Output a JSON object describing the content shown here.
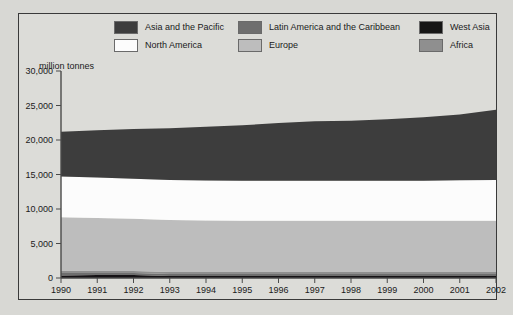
{
  "axis_title": "million tonnes",
  "legend": {
    "items": [
      {
        "label": "Asia and the Pacific",
        "color": "#3d3d3d",
        "col": 0,
        "row": 0
      },
      {
        "label": "North America",
        "color": "#fcfcfc",
        "col": 0,
        "row": 1
      },
      {
        "label": "Latin America and the Caribbean",
        "color": "#6e6e6e",
        "col": 1,
        "row": 0
      },
      {
        "label": "Europe",
        "color": "#bdbdbd",
        "col": 1,
        "row": 1
      },
      {
        "label": "West Asia",
        "color": "#151515",
        "col": 2,
        "row": 0
      },
      {
        "label": "Africa",
        "color": "#8f8f8f",
        "col": 2,
        "row": 1
      }
    ]
  },
  "chart_data": {
    "type": "area",
    "title": "",
    "subtitle": "",
    "xlabel": "",
    "ylabel": "million tonnes",
    "stacked": true,
    "grid": false,
    "legend_position": "top",
    "xlim": [
      1990,
      2002
    ],
    "ylim": [
      0,
      30000
    ],
    "yticks": [
      0,
      5000,
      10000,
      15000,
      20000,
      25000,
      30000
    ],
    "ytick_labels": [
      "0",
      "5,000",
      "10,000",
      "15,000",
      "20,000",
      "25,000",
      "30,000"
    ],
    "x": [
      1990,
      1991,
      1992,
      1993,
      1994,
      1995,
      1996,
      1997,
      1998,
      1999,
      2000,
      2001,
      2002
    ],
    "xtick_labels": [
      "1990",
      "1991",
      "1992",
      "1993",
      "1994",
      "1995",
      "1996",
      "1997",
      "1998",
      "1999",
      "2000",
      "2001",
      "2002"
    ],
    "stack_order_bottom_to_top": [
      "West Asia",
      "Latin America and the Caribbean",
      "Africa",
      "Europe",
      "North America",
      "Asia and the Pacific"
    ],
    "series": [
      {
        "name": "West Asia",
        "color": "#151215",
        "values": [
          380,
          420,
          430,
          300,
          300,
          300,
          300,
          300,
          300,
          300,
          300,
          300,
          300
        ]
      },
      {
        "name": "Latin America and the Caribbean",
        "color": "#6e6e6e",
        "values": [
          330,
          300,
          290,
          290,
          290,
          290,
          290,
          290,
          290,
          290,
          290,
          290,
          290
        ]
      },
      {
        "name": "Africa",
        "color": "#8f8f8f",
        "values": [
          330,
          300,
          290,
          290,
          290,
          290,
          290,
          290,
          290,
          290,
          290,
          290,
          290
        ]
      },
      {
        "name": "Europe",
        "color": "#bdbdbd",
        "values": [
          7760,
          7680,
          7590,
          7520,
          7450,
          7400,
          7420,
          7420,
          7420,
          7420,
          7420,
          7420,
          7420
        ]
      },
      {
        "name": "North America",
        "color": "#fcfcfc",
        "values": [
          5900,
          5850,
          5800,
          5800,
          5800,
          5800,
          5800,
          5800,
          5800,
          5800,
          5800,
          5850,
          5900
        ]
      },
      {
        "name": "Asia and the Pacific",
        "color": "#3d3d3d",
        "values": [
          6500,
          6850,
          7200,
          7500,
          7800,
          8050,
          8350,
          8600,
          8700,
          8900,
          9200,
          9550,
          10200
        ]
      }
    ],
    "totals": [
      21200,
      21400,
      21600,
      21700,
      21930,
      22130,
      22450,
      22700,
      22800,
      23000,
      23300,
      23700,
      24400
    ]
  }
}
